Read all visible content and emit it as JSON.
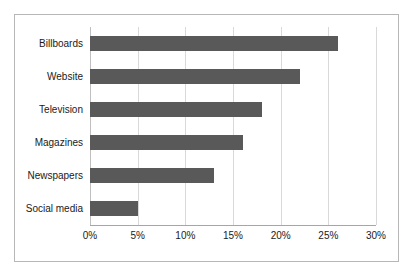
{
  "chart_data": {
    "type": "bar",
    "orientation": "horizontal",
    "title": "",
    "xlabel": "",
    "ylabel": "",
    "categories": [
      "Billboards",
      "Website",
      "Television",
      "Magazines",
      "Newspapers",
      "Social media"
    ],
    "values": [
      26,
      22,
      18,
      16,
      13,
      5
    ],
    "value_suffix": "%",
    "xlim": [
      0,
      30
    ],
    "xticks": [
      0,
      5,
      10,
      15,
      20,
      25,
      30
    ],
    "xtick_labels": [
      "0%",
      "5%",
      "10%",
      "15%",
      "20%",
      "25%",
      "30%"
    ],
    "grid": true,
    "legend": false,
    "bar_color": "#595959",
    "gridline_color": "#d9d9d9",
    "axis_color": "#a6a6a6",
    "border_color": "#b7b7b7",
    "background": "#ffffff"
  }
}
